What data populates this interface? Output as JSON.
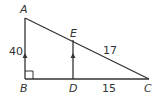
{
  "diagram": {
    "type": "geometry-similar-triangles",
    "colors": {
      "line": "#333333",
      "background": "#ffffff"
    },
    "vertices": [
      {
        "name": "A",
        "x": 25,
        "y": 18
      },
      {
        "name": "B",
        "x": 25,
        "y": 79
      },
      {
        "name": "C",
        "x": 149,
        "y": 79
      },
      {
        "name": "D",
        "x": 73,
        "y": 79
      },
      {
        "name": "E",
        "x": 73,
        "y": 40
      }
    ],
    "segments": [
      {
        "from": "A",
        "to": "B",
        "parallel_mark": true,
        "length_label": "40"
      },
      {
        "from": "B",
        "to": "C"
      },
      {
        "from": "A",
        "to": "C"
      },
      {
        "from": "E",
        "to": "D",
        "parallel_mark": true
      },
      {
        "from": "E",
        "to": "C",
        "length_label": "17"
      },
      {
        "from": "D",
        "to": "C",
        "length_label": "15"
      }
    ],
    "right_angle_at": "B",
    "labels": {
      "A": "A",
      "B": "B",
      "C": "C",
      "D": "D",
      "E": "E",
      "AB": "40",
      "EC": "17",
      "DC": "15"
    }
  }
}
